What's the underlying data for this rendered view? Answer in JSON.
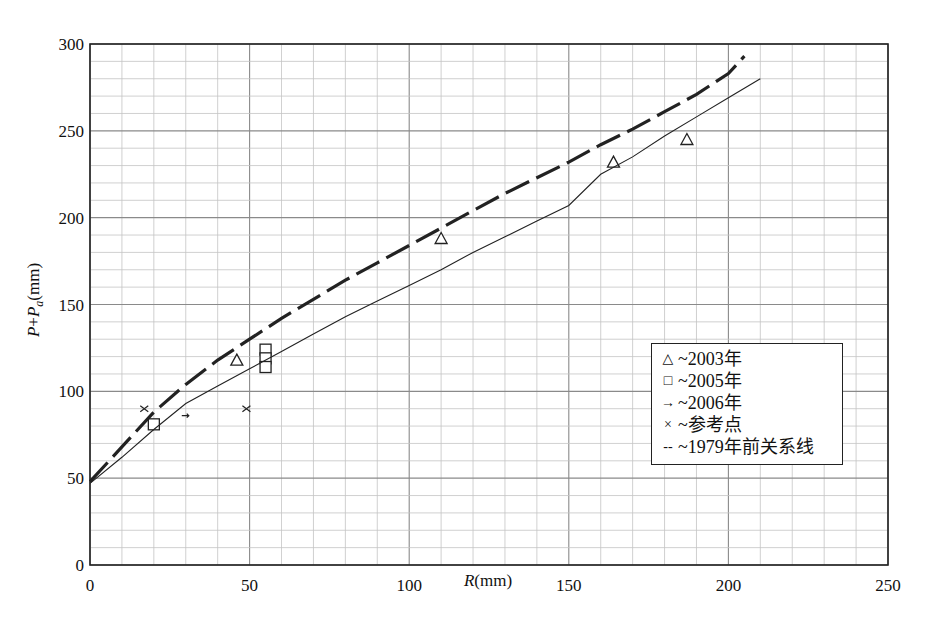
{
  "chart_data": {
    "type": "scatter",
    "title": "",
    "xlabel": "R(mm)",
    "ylabel": "P+Pa(mm)",
    "xlim": [
      0,
      250
    ],
    "ylim": [
      0,
      300
    ],
    "x_ticks": [
      0,
      50,
      100,
      150,
      200,
      250
    ],
    "y_ticks": [
      0,
      50,
      100,
      150,
      200,
      250,
      300
    ],
    "x_tick_labels": [
      "0",
      "50",
      "100",
      "150",
      "200",
      "250"
    ],
    "y_tick_labels": [
      "0",
      "50",
      "100",
      "150",
      "200",
      "250",
      "300"
    ],
    "grid": true,
    "minor_grid_step": 10,
    "legend_position": "right-center",
    "series": [
      {
        "name": "~2003年",
        "kind": "scatter",
        "marker": "triangle",
        "points": [
          [
            46,
            118
          ],
          [
            110,
            188
          ],
          [
            164,
            232
          ],
          [
            187,
            245
          ]
        ]
      },
      {
        "name": "~2005年",
        "kind": "scatter",
        "marker": "square",
        "points": [
          [
            20,
            81
          ],
          [
            55,
            124
          ],
          [
            55,
            119
          ],
          [
            55,
            114
          ]
        ]
      },
      {
        "name": "~2006年",
        "kind": "scatter",
        "marker": "arrow",
        "points": [
          [
            30,
            86
          ]
        ]
      },
      {
        "name": "~参考点",
        "kind": "scatter",
        "marker": "x",
        "points": [
          [
            17,
            90
          ],
          [
            49,
            90
          ]
        ]
      },
      {
        "name": "~1979年前关系线",
        "kind": "line",
        "style": "dashed",
        "points": [
          [
            0,
            48
          ],
          [
            10,
            68
          ],
          [
            20,
            88
          ],
          [
            30,
            104
          ],
          [
            40,
            118
          ],
          [
            50,
            130
          ],
          [
            60,
            142
          ],
          [
            70,
            153
          ],
          [
            80,
            164
          ],
          [
            90,
            174
          ],
          [
            100,
            184
          ],
          [
            110,
            194
          ],
          [
            120,
            204
          ],
          [
            130,
            214
          ],
          [
            140,
            223
          ],
          [
            150,
            232
          ],
          [
            160,
            242
          ],
          [
            170,
            251
          ],
          [
            180,
            261
          ],
          [
            190,
            271
          ],
          [
            200,
            283
          ],
          [
            205,
            293
          ]
        ]
      },
      {
        "name": "fitted relation (solid)",
        "kind": "line",
        "style": "solid",
        "points": [
          [
            0,
            47
          ],
          [
            10,
            62
          ],
          [
            20,
            78
          ],
          [
            30,
            93
          ],
          [
            40,
            103
          ],
          [
            50,
            113
          ],
          [
            60,
            123
          ],
          [
            70,
            133
          ],
          [
            80,
            143
          ],
          [
            90,
            152
          ],
          [
            100,
            161
          ],
          [
            110,
            170
          ],
          [
            120,
            180
          ],
          [
            130,
            189
          ],
          [
            140,
            198
          ],
          [
            150,
            207
          ],
          [
            160,
            225
          ],
          [
            170,
            235
          ],
          [
            180,
            247
          ],
          [
            190,
            258
          ],
          [
            200,
            269
          ],
          [
            210,
            280
          ]
        ]
      }
    ]
  },
  "legend": {
    "items": [
      {
        "symbol": "△",
        "label": "~2003年"
      },
      {
        "symbol": "□",
        "label": "~2005年"
      },
      {
        "symbol": "→",
        "label": "~2006年"
      },
      {
        "symbol": "×",
        "label": "~参考点"
      },
      {
        "symbol": "--",
        "label": "~1979年前关系线"
      }
    ]
  },
  "colors": {
    "axis": "#222222",
    "major_grid": "#8a8a8a",
    "minor_grid": "#c4c4c4",
    "series": "#222222"
  }
}
